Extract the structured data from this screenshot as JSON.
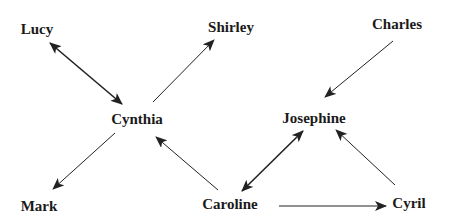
{
  "diagram": {
    "type": "directed-graph",
    "nodes": [
      {
        "id": "lucy",
        "label": "Lucy",
        "x": 37,
        "y": 29
      },
      {
        "id": "shirley",
        "label": "Shirley",
        "x": 231,
        "y": 27
      },
      {
        "id": "charles",
        "label": "Charles",
        "x": 397,
        "y": 24
      },
      {
        "id": "cynthia",
        "label": "Cynthia",
        "x": 137,
        "y": 119
      },
      {
        "id": "josephine",
        "label": "Josephine",
        "x": 314,
        "y": 118
      },
      {
        "id": "mark",
        "label": "Mark",
        "x": 39,
        "y": 206
      },
      {
        "id": "caroline",
        "label": "Caroline",
        "x": 230,
        "y": 204
      },
      {
        "id": "cyril",
        "label": "Cyril",
        "x": 409,
        "y": 203
      }
    ],
    "edges": [
      {
        "from": "lucy",
        "to": "cynthia",
        "bidirectional": true
      },
      {
        "from": "cynthia",
        "to": "shirley",
        "bidirectional": false
      },
      {
        "from": "charles",
        "to": "josephine",
        "bidirectional": false
      },
      {
        "from": "cynthia",
        "to": "mark",
        "bidirectional": false
      },
      {
        "from": "caroline",
        "to": "cynthia",
        "bidirectional": false
      },
      {
        "from": "caroline",
        "to": "josephine",
        "bidirectional": true
      },
      {
        "from": "cyril",
        "to": "josephine",
        "bidirectional": false
      },
      {
        "from": "caroline",
        "to": "cyril",
        "bidirectional": false
      }
    ],
    "colors": {
      "line": "#222222",
      "text": "#1a1a1a",
      "background": "#ffffff"
    }
  }
}
